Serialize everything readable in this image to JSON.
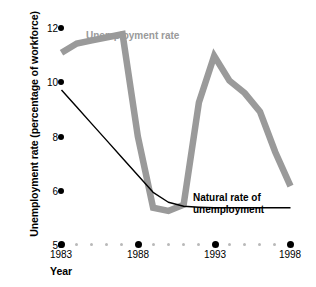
{
  "chart_data": {
    "type": "line",
    "title": "",
    "xlabel": "Year",
    "ylabel": "Unemployment rate (percentage of workforce)",
    "xlim": [
      1983,
      1998
    ],
    "ylim": [
      5,
      12
    ],
    "ytick_values": [
      12,
      10,
      8,
      6,
      5
    ],
    "ytick_labels": [
      "12",
      "10",
      "8",
      "6",
      "5"
    ],
    "xtick_values": [
      1983,
      1988,
      1993,
      1998
    ],
    "xtick_labels": [
      "1983",
      "1988",
      "1993",
      "1998"
    ],
    "x_minor_values": [
      1984,
      1985,
      1986,
      1987,
      1989,
      1990,
      1991,
      1992,
      1994,
      1995,
      1996,
      1997
    ],
    "grid": false,
    "legend_position": "inline-annotations",
    "series": [
      {
        "name": "Unemployment rate",
        "color": "#9a9a9a",
        "style": "thick",
        "x": [
          1983,
          1984,
          1985,
          1986,
          1987,
          1988,
          1989,
          1990,
          1991,
          1992,
          1993,
          1994,
          1995,
          1996,
          1997,
          1998
        ],
        "values": [
          11.2,
          11.5,
          11.6,
          11.7,
          11.8,
          8.5,
          6.2,
          6.1,
          6.3,
          9.6,
          11.1,
          10.3,
          9.9,
          9.3,
          8.0,
          6.9
        ]
      },
      {
        "name": "Natural rate of unemployment",
        "color": "#000000",
        "style": "thin",
        "x": [
          1983,
          1984,
          1985,
          1986,
          1987,
          1988,
          1989,
          1990,
          1991,
          1992,
          1993,
          1994,
          1995,
          1996,
          1997,
          1998
        ],
        "values": [
          10.0,
          9.45,
          8.9,
          8.35,
          7.8,
          7.25,
          6.7,
          6.38,
          6.25,
          6.22,
          6.2,
          6.2,
          6.2,
          6.2,
          6.2,
          6.2
        ]
      }
    ],
    "annotations": [
      {
        "text": "Unemployment rate",
        "color": "#9a9a9a"
      },
      {
        "text": "Natural rate of",
        "color": "#000000"
      },
      {
        "text": "unemployment",
        "color": "#000000"
      }
    ]
  },
  "axes": {
    "y_title": "Unemployment rate (percentage of workforce)",
    "x_title": "Year",
    "y_ticks": [
      {
        "label": "12"
      },
      {
        "label": "10"
      },
      {
        "label": "8"
      },
      {
        "label": "6"
      },
      {
        "label": "5"
      }
    ],
    "x_ticks": [
      {
        "label": "1983"
      },
      {
        "label": "1988"
      },
      {
        "label": "1993"
      },
      {
        "label": "1998"
      }
    ]
  },
  "labels": {
    "unemployment_rate": "Unemployment rate",
    "natural_rate_line1": "Natural rate of",
    "natural_rate_line2": "unemployment"
  },
  "colors": {
    "unemployment_series": "#9a9a9a",
    "natural_series": "#000000",
    "minor_tick": "#b9b9b9",
    "background": "#ffffff"
  }
}
